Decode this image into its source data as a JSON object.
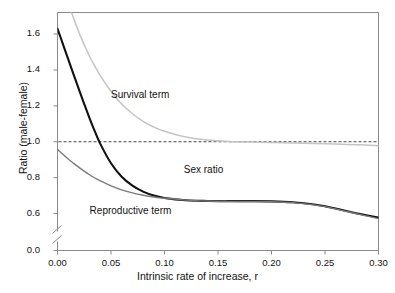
{
  "chart_data": {
    "type": "line",
    "title": "",
    "xlabel": "Intrinsic rate of increase, r",
    "ylabel": "Ratio (male-female)",
    "xlim": [
      0.0,
      0.3
    ],
    "ylim": [
      0.5,
      1.72
    ],
    "xticks": [
      "0.00",
      "0.05",
      "0.10",
      "0.15",
      "0.20",
      "0.25",
      "0.30"
    ],
    "xtick_values": [
      0.0,
      0.05,
      0.1,
      0.15,
      0.2,
      0.25,
      0.3
    ],
    "yticks": [
      "0.0",
      "0.6",
      "0.8",
      "1.0",
      "1.2",
      "1.4",
      "1.6"
    ],
    "ytick_values": [
      0.0,
      0.6,
      0.8,
      1.0,
      1.2,
      1.4,
      1.6
    ],
    "axis_break": true,
    "axis_break_note": "y-axis is broken between 0.0 and 0.6",
    "grid": false,
    "legend": "inline-annotations",
    "reference_line": {
      "label": "",
      "y": 1.0,
      "style": "dashed",
      "color": "#444444"
    },
    "series": [
      {
        "name": "Survival term",
        "color": "#c4c4c4",
        "x": [
          0.0,
          0.005,
          0.01,
          0.015,
          0.02,
          0.025,
          0.03,
          0.035,
          0.04,
          0.05,
          0.06,
          0.07,
          0.08,
          0.09,
          0.1,
          0.12,
          0.14,
          0.16,
          0.18,
          0.2,
          0.22,
          0.24,
          0.26,
          0.28,
          0.3
        ],
        "y": [
          1.96,
          1.86,
          1.77,
          1.69,
          1.61,
          1.54,
          1.475,
          1.42,
          1.368,
          1.28,
          1.21,
          1.156,
          1.114,
          1.082,
          1.058,
          1.026,
          1.01,
          1.002,
          0.998,
          0.996,
          0.993,
          0.99,
          0.987,
          0.983,
          0.978
        ]
      },
      {
        "name": "Sex ratio",
        "color": "#111111",
        "x": [
          0.0,
          0.005,
          0.01,
          0.015,
          0.02,
          0.025,
          0.03,
          0.035,
          0.04,
          0.05,
          0.06,
          0.07,
          0.08,
          0.09,
          0.1,
          0.12,
          0.14,
          0.16,
          0.18,
          0.2,
          0.22,
          0.24,
          0.26,
          0.28,
          0.3
        ],
        "y": [
          1.63,
          1.545,
          1.46,
          1.375,
          1.292,
          1.21,
          1.13,
          1.056,
          0.988,
          0.88,
          0.805,
          0.755,
          0.722,
          0.7,
          0.687,
          0.674,
          0.67,
          0.669,
          0.669,
          0.668,
          0.663,
          0.65,
          0.628,
          0.6,
          0.578
        ]
      },
      {
        "name": "Reproductive term",
        "color": "#7a7a7a",
        "x": [
          0.0,
          0.005,
          0.01,
          0.015,
          0.02,
          0.025,
          0.03,
          0.035,
          0.04,
          0.05,
          0.06,
          0.07,
          0.08,
          0.09,
          0.1,
          0.12,
          0.14,
          0.16,
          0.18,
          0.2,
          0.22,
          0.24,
          0.26,
          0.28,
          0.3
        ],
        "y": [
          0.958,
          0.93,
          0.904,
          0.88,
          0.857,
          0.836,
          0.816,
          0.798,
          0.782,
          0.754,
          0.732,
          0.715,
          0.702,
          0.692,
          0.685,
          0.675,
          0.67,
          0.668,
          0.667,
          0.666,
          0.661,
          0.648,
          0.626,
          0.598,
          0.572
        ]
      }
    ],
    "annotations": [
      {
        "text": "Survival term",
        "x": 0.05,
        "y": 1.255
      },
      {
        "text": "Sex ratio",
        "x": 0.118,
        "y": 0.838
      },
      {
        "text": "Reproductive term",
        "x": 0.03,
        "y": 0.608
      }
    ]
  }
}
